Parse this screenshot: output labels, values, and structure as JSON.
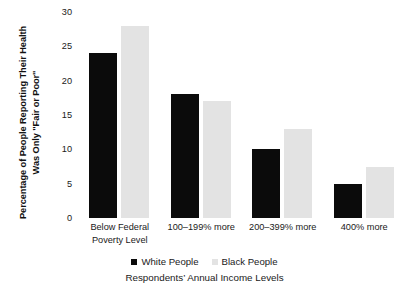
{
  "chart_data": {
    "type": "bar",
    "title": "",
    "subtitle": "",
    "xlabel": "Respondents’ Annual Income Levels",
    "ylabel": "Percentage of People Reporting Their Health Was Only \"Fair or Poor\"",
    "categories": [
      "Below Federal\nPoverty Level",
      "100–199% more",
      "200–399% more",
      "400% more"
    ],
    "series": [
      {
        "name": "White  People",
        "color": "#0b0b0b",
        "values": [
          24,
          18,
          10,
          5
        ]
      },
      {
        "name": "Black People",
        "color": "#e3e3e3",
        "values": [
          28,
          17,
          13,
          7.5
        ]
      }
    ],
    "ylim": [
      0,
      30
    ],
    "ytick_labels": [
      "0",
      "5",
      "10",
      "15",
      "20",
      "25",
      "30"
    ],
    "ytick_values": [
      0,
      5,
      10,
      15,
      20,
      25,
      30
    ],
    "grid": false,
    "legend_position": "bottom"
  },
  "colors": {
    "background": "#ffffff",
    "text": "#1a1a1a",
    "series_white_people": "#0b0b0b",
    "series_black_people": "#e3e3e3"
  }
}
